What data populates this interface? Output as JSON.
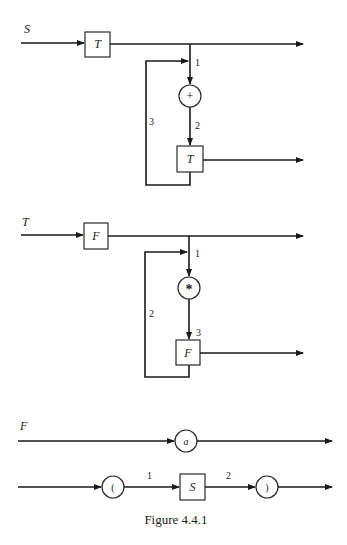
{
  "diagrams": [
    {
      "nonterminal": "S",
      "first_box": "T",
      "node_circle": "+",
      "loop_box": "T",
      "edge_labels": [
        "1",
        "2",
        "3"
      ]
    },
    {
      "nonterminal": "T",
      "first_box": "F",
      "node_circle": "*",
      "loop_box": "F",
      "edge_labels": [
        "1",
        "2",
        "3"
      ]
    },
    {
      "nonterminal": "F",
      "alt1_circle": "a",
      "alt2_open": "(",
      "alt2_box": "S",
      "alt2_close": ")",
      "edge_labels": [
        "1",
        "2"
      ]
    }
  ],
  "caption": "Figure 4.4.1"
}
